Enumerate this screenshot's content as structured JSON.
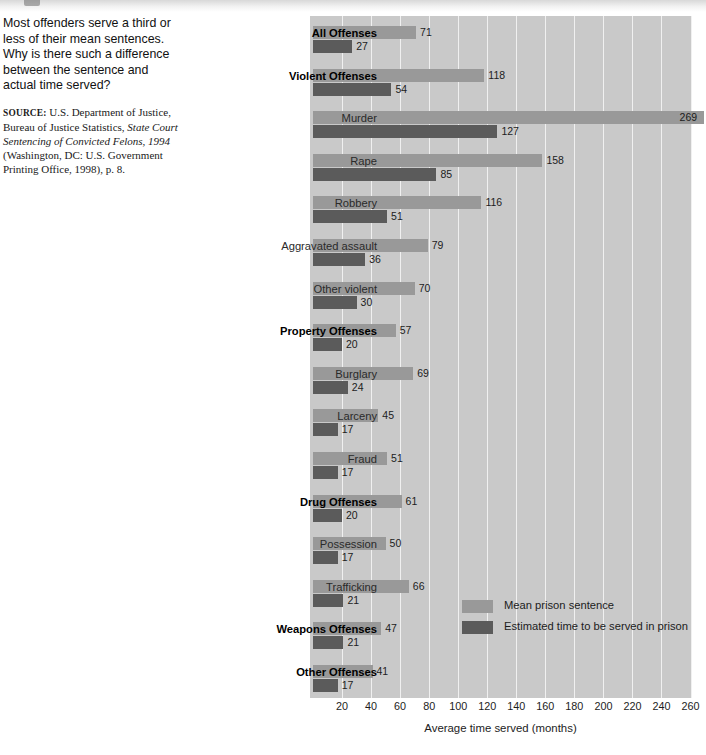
{
  "caption": {
    "question": "Most offenders serve a third or less of their mean sentences. Why is there such a difference between the sentence and actual time served?",
    "source_label": "Source:",
    "source_text_1": " U.S. Department of Justice, Bureau of Justice Statistics, ",
    "source_title": "State Court Sentencing of Convicted Felons, 1994",
    "source_text_2": " (Washington, DC: U.S. Government Printing Office, 1998), p. 8."
  },
  "legend": {
    "mean_label": "Mean prison sentence",
    "served_label": "Estimated time to be served in prison"
  },
  "colors": {
    "mean": "#999999",
    "served": "#5b5b5b",
    "plot_background": "#c9c9c9",
    "gridline": "#f0f0f0",
    "page_background": "#ffffff"
  },
  "chart_data": {
    "type": "bar",
    "orientation": "horizontal",
    "title": "",
    "xlabel": "Average time served (months)",
    "ylabel": "",
    "xlim": [
      0,
      280
    ],
    "xticks": [
      20,
      40,
      60,
      80,
      100,
      120,
      140,
      160,
      180,
      200,
      220,
      240,
      260
    ],
    "grid": true,
    "legend_position": "inside-lower-right",
    "categories": [
      "All Offenses",
      "Violent Offenses",
      "Murder",
      "Rape",
      "Robbery",
      "Aggravated assault",
      "Other violent",
      "Property Offenses",
      "Burglary",
      "Larceny",
      "Fraud",
      "Drug Offenses",
      "Possession",
      "Trafficking",
      "Weapons Offenses",
      "Other Offenses"
    ],
    "category_emphasis": [
      true,
      true,
      false,
      false,
      false,
      false,
      false,
      true,
      false,
      false,
      false,
      true,
      false,
      false,
      true,
      true
    ],
    "series": [
      {
        "name": "Mean prison sentence",
        "color": "#999999",
        "values": [
          71,
          118,
          269,
          158,
          116,
          79,
          70,
          57,
          69,
          45,
          51,
          61,
          50,
          66,
          47,
          41
        ]
      },
      {
        "name": "Estimated time to be served in prison",
        "color": "#5b5b5b",
        "values": [
          27,
          54,
          127,
          85,
          51,
          36,
          30,
          20,
          24,
          17,
          17,
          20,
          17,
          21,
          21,
          17
        ]
      }
    ]
  }
}
